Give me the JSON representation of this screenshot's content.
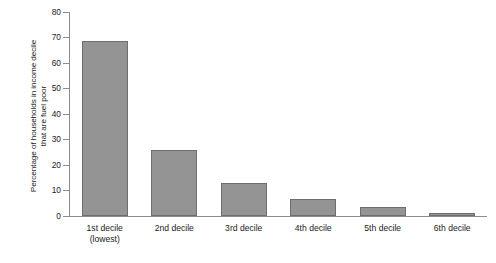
{
  "chart_data": {
    "type": "bar",
    "title": "",
    "subtitle": "",
    "xlabel": "",
    "ylabel_line1": "Percentage of households in income decile",
    "ylabel_line2": "that are fuel poor",
    "categories": [
      "1st decile\n(lowest)",
      "2nd decile",
      "3rd decile",
      "4th decile",
      "5th decile",
      "6th decile"
    ],
    "values": [
      68.5,
      26.0,
      13.0,
      6.5,
      3.5,
      1.2
    ],
    "ylim": [
      0,
      80
    ],
    "yticks": [
      0,
      10,
      20,
      30,
      40,
      50,
      60,
      70,
      80
    ],
    "ytick_labels": [
      "0",
      "10",
      "20",
      "30",
      "40",
      "50",
      "60",
      "70",
      "80"
    ],
    "grid": false,
    "legend": false,
    "legend_position": "none",
    "bar_fill_color": "#949494",
    "bar_edge_color": "#6e6e6e",
    "axis_color": "#8c8c8c",
    "background_color": "#ffffff"
  }
}
